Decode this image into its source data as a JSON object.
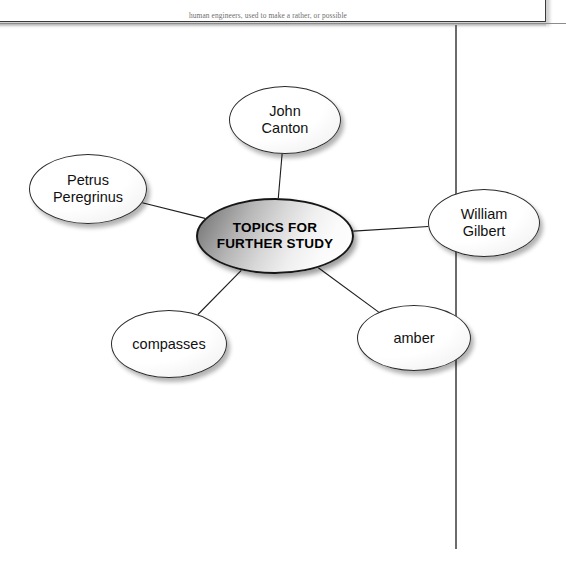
{
  "page": {
    "textbox": {
      "text": "human engineers, used to make a rather, or possible"
    },
    "rules": {
      "horizontal_rule_color": "#8c8c8c",
      "vertical_rule_color": "#6c6c6c"
    }
  },
  "diagram": {
    "type": "concept-map",
    "title": "TOPICS FOR FURTHER STUDY",
    "central_node": {
      "id": "topics-for-further-study",
      "label": "TOPICS FOR\nFURTHER STUDY",
      "cx": 275,
      "cy": 236,
      "rx": 79,
      "ry": 38,
      "fill": "#b6b6b6",
      "stroke": "#161616"
    },
    "satellite_nodes": [
      {
        "id": "john-canton",
        "label": "John\nCanton",
        "cx": 285,
        "cy": 120,
        "rx": 56,
        "ry": 34,
        "fill": "#ffffff",
        "stroke": "#2b2b2b"
      },
      {
        "id": "petrus-peregrinus",
        "label": "Petrus\nPeregrinus",
        "cx": 88,
        "cy": 189,
        "rx": 59,
        "ry": 35,
        "fill": "#ffffff",
        "stroke": "#2b2b2b"
      },
      {
        "id": "william-gilbert",
        "label": "William\nGilbert",
        "cx": 484,
        "cy": 223,
        "rx": 56,
        "ry": 34,
        "fill": "#ffffff",
        "stroke": "#2b2b2b"
      },
      {
        "id": "compasses",
        "label": "compasses",
        "cx": 169,
        "cy": 344,
        "rx": 58,
        "ry": 34,
        "fill": "#ffffff",
        "stroke": "#2b2b2b"
      },
      {
        "id": "amber",
        "label": "amber",
        "cx": 414,
        "cy": 338,
        "rx": 57,
        "ry": 33,
        "fill": "#ffffff",
        "stroke": "#2b2b2b"
      }
    ],
    "connectors": [
      {
        "from": "topics-for-further-study",
        "to": "john-canton"
      },
      {
        "from": "topics-for-further-study",
        "to": "petrus-peregrinus"
      },
      {
        "from": "topics-for-further-study",
        "to": "william-gilbert"
      },
      {
        "from": "topics-for-further-study",
        "to": "compasses"
      },
      {
        "from": "topics-for-further-study",
        "to": "amber"
      }
    ],
    "connector_color": "#1d1d1d"
  }
}
